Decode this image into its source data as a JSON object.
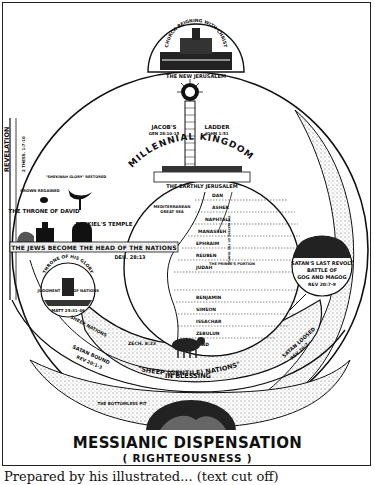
{
  "diagram": {
    "title": "MESSIANIC DISPENSATION",
    "subtitle": "( RIGHTEOUSNESS )",
    "top_dome": {
      "arc_label": "CHURCH REIGNING WITH CHRIST",
      "label": "THE NEW JERUSALEM"
    },
    "ladder": {
      "left_label": "JACOB'S",
      "left_ref": "GEN 28:10-15",
      "right_label": "LADDER",
      "right_ref": "JOHN 1:51"
    },
    "arc_heading": "MILLENNIAL KINGDOM",
    "earthly_city": "THE EARTHLY JERUSALEM",
    "revelation_band": {
      "label": "REVELATION",
      "ref": "2 THESS. 1:7-10"
    },
    "left_panel": {
      "crown_label": "CROWN REGAINED",
      "glory_label": "\"SHEKINAH GLORY\" RESTORED",
      "throne_label": "THE THRONE OF DAVID",
      "temple_label": "EZEKIEL'S TEMPLE"
    },
    "jews_band": {
      "label": "THE JEWS BECOME THE HEAD OF THE NATIONS",
      "ref": "DEU. 28:13"
    },
    "land_map": {
      "sea_label": "MEDITERRANEAN",
      "sea_sub": "GREAT SEA",
      "prince_label": "THE PRINCE'S PORTION",
      "river_label": "THE WATERS OF THE TEMPLE",
      "tribes_north": [
        "DAN",
        "ASHER",
        "NAPHTALI",
        "MANASSEH",
        "EPHRAIM",
        "REUBEN",
        "JUDAH"
      ],
      "tribes_south": [
        "BENJAMIN",
        "SIMEON",
        "ISSACHAR",
        "ZEBULUN",
        "GAD"
      ]
    },
    "judgment": {
      "arc_label": "THRONE OF HIS GLORY",
      "left_label": "JUDGMENT",
      "right_label": "OF NATIONS",
      "ref": "MATT 25:31-46"
    },
    "sheep_band": {
      "label": "SHEEP NATIONS",
      "ref": "ZECH. 8:23",
      "blessing_line1": "\"SHEEP (GENTILE) NATIONS\"",
      "blessing_line2": "IN BLESSING"
    },
    "satan_bound": {
      "label": "SATAN BOUND",
      "ref": "REV 20:1-3"
    },
    "satan_loosed": {
      "label": "SATAN LOOSED",
      "ref": "REV 20:7"
    },
    "right_panel": {
      "line1": "SATAN'S LAST REVOLT",
      "line2": "BATTLE OF",
      "line3": "GOG AND MAGOG",
      "ref": "REV 20:7-9"
    },
    "bottom_pit": {
      "label": "THE BOTTOMLESS PIT"
    },
    "caption_partial": "Prepared by his illustrated... (text cut off)"
  },
  "colors": {
    "ink": "#111111",
    "paper": "#ffffff",
    "stipple": "#8a8a8a"
  }
}
